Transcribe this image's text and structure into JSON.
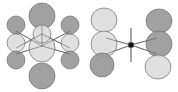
{
  "figure": {
    "width": 178,
    "height": 92,
    "background_color": "#ffffff"
  },
  "palette": {
    "lobe_dark_fill": "#9a9a9a",
    "lobe_light_fill": "#dedede",
    "lobe_stroke": "#6e6e6e",
    "bond_line": "#555555",
    "node_fill": "#111111",
    "background": "#ffffff"
  },
  "structures": [
    {
      "id": "left-structure",
      "name": "left-orbital-cluster",
      "center": {
        "x": 43,
        "y": 46
      },
      "lobes": [
        {
          "id": "L-top",
          "name": "top-lobe",
          "shade": "dark",
          "cx": 42,
          "cy": 16,
          "rx": 13,
          "ry": 13
        },
        {
          "id": "L-center",
          "name": "center-lobe",
          "shade": "light",
          "cx": 42,
          "cy": 48,
          "rx": 13,
          "ry": 14
        },
        {
          "id": "L-bottom",
          "name": "bottom-lobe",
          "shade": "dark",
          "cx": 42,
          "cy": 76,
          "rx": 13,
          "ry": 13
        },
        {
          "id": "L-upper-mid",
          "name": "upper-inner-lobe",
          "shade": "light",
          "cx": 42,
          "cy": 34,
          "rx": 9,
          "ry": 9
        },
        {
          "id": "L-left-top",
          "name": "left-upper-lobe",
          "shade": "dark",
          "cx": 16,
          "cy": 25,
          "rx": 9,
          "ry": 9
        },
        {
          "id": "L-left-mid",
          "name": "left-middle-lobe",
          "shade": "light",
          "cx": 16,
          "cy": 43,
          "rx": 9,
          "ry": 9
        },
        {
          "id": "L-left-bot",
          "name": "left-lower-lobe",
          "shade": "dark",
          "cx": 16,
          "cy": 60,
          "rx": 9,
          "ry": 9
        },
        {
          "id": "L-right-top",
          "name": "right-upper-lobe",
          "shade": "dark",
          "cx": 70,
          "cy": 25,
          "rx": 9,
          "ry": 9
        },
        {
          "id": "L-right-mid",
          "name": "right-middle-lobe",
          "shade": "light",
          "cx": 70,
          "cy": 43,
          "rx": 9,
          "ry": 9
        },
        {
          "id": "L-right-bot",
          "name": "right-lower-lobe",
          "shade": "dark",
          "cx": 70,
          "cy": 60,
          "rx": 9,
          "ry": 9
        }
      ],
      "bonds": [
        {
          "name": "bond-center-to-left-upper",
          "x1": 42,
          "y1": 46,
          "x2": 16,
          "y2": 31
        },
        {
          "name": "bond-center-to-left-lower",
          "x1": 42,
          "y1": 46,
          "x2": 16,
          "y2": 54
        },
        {
          "name": "bond-center-to-right-upper",
          "x1": 42,
          "y1": 46,
          "x2": 70,
          "y2": 31
        },
        {
          "name": "bond-center-to-right-lower",
          "x1": 42,
          "y1": 46,
          "x2": 70,
          "y2": 54
        },
        {
          "name": "bond-upper-left-crossing",
          "x1": 42,
          "y1": 34,
          "x2": 16,
          "y2": 48
        },
        {
          "name": "bond-upper-right-crossing",
          "x1": 42,
          "y1": 34,
          "x2": 70,
          "y2": 48
        },
        {
          "name": "bond-vertical-axis",
          "x1": 42,
          "y1": 26,
          "x2": 42,
          "y2": 46
        }
      ]
    },
    {
      "id": "right-structure",
      "name": "right-orbital-cluster",
      "center": {
        "x": 131,
        "y": 45
      },
      "node": {
        "name": "center-node-dot",
        "cx": 131,
        "cy": 45,
        "size": 5
      },
      "lobes": [
        {
          "id": "R-left-top",
          "name": "left-upper-lobe",
          "shade": "light",
          "cx": 104,
          "cy": 20,
          "rx": 13,
          "ry": 12
        },
        {
          "id": "R-left-mid",
          "name": "left-middle-lobe",
          "shade": "light",
          "cx": 104,
          "cy": 44,
          "rx": 13,
          "ry": 13
        },
        {
          "id": "R-left-bot",
          "name": "left-lower-lobe",
          "shade": "dark",
          "cx": 102,
          "cy": 65,
          "rx": 12,
          "ry": 12
        },
        {
          "id": "R-right-top",
          "name": "right-upper-lobe",
          "shade": "dark",
          "cx": 159,
          "cy": 21,
          "rx": 13,
          "ry": 12
        },
        {
          "id": "R-right-mid",
          "name": "right-middle-lobe",
          "shade": "dark",
          "cx": 159,
          "cy": 44,
          "rx": 13,
          "ry": 13
        },
        {
          "id": "R-right-bot",
          "name": "right-lower-lobe",
          "shade": "light",
          "cx": 158,
          "cy": 67,
          "rx": 13,
          "ry": 12
        }
      ],
      "bonds": [
        {
          "name": "bond-node-to-left-upper",
          "x1": 131,
          "y1": 45,
          "x2": 106,
          "y2": 38
        },
        {
          "name": "bond-node-to-left-lower",
          "x1": 131,
          "y1": 45,
          "x2": 106,
          "y2": 54
        },
        {
          "name": "bond-node-to-right-upper",
          "x1": 131,
          "y1": 45,
          "x2": 157,
          "y2": 38
        },
        {
          "name": "bond-node-to-right-lower",
          "x1": 131,
          "y1": 45,
          "x2": 157,
          "y2": 54
        },
        {
          "name": "bond-node-vertical",
          "x1": 131,
          "y1": 28,
          "x2": 131,
          "y2": 62
        }
      ]
    }
  ]
}
